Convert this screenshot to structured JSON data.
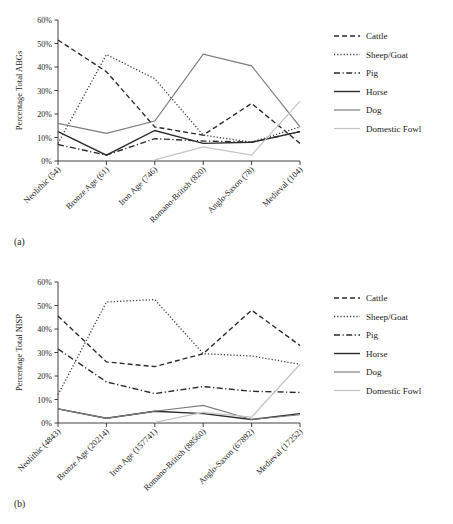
{
  "figure": {
    "panel_a_label": "(a)",
    "panel_b_label": "(b)"
  },
  "legend": {
    "entries": [
      {
        "name": "Cattle",
        "label": "Cattle",
        "color": "#2b2b2b",
        "dash": "5,3",
        "width": 1.4
      },
      {
        "name": "Sheep/Goat",
        "label": "Sheep/Goat",
        "color": "#3a3a3a",
        "dash": "1.2,2",
        "width": 1.3
      },
      {
        "name": "Pig",
        "label": "Pig",
        "color": "#2b2b2b",
        "dash": "6,2.5,1.2,2.5",
        "width": 1.4
      },
      {
        "name": "Horse",
        "label": "Horse",
        "color": "#2b2b2b",
        "dash": "none",
        "width": 1.4
      },
      {
        "name": "Dog",
        "label": "Dog",
        "color": "#7d7d7d",
        "dash": "none",
        "width": 1.2
      },
      {
        "name": "Domestic Fowl",
        "label": "Domestic Fowl",
        "color": "#c4c4c4",
        "dash": "none",
        "width": 1.2
      }
    ]
  },
  "chart_data": [
    {
      "id": "a",
      "type": "line",
      "title": "",
      "xlabel": "",
      "ylabel": "Percentage Total ABGs",
      "ylim": [
        0,
        60
      ],
      "yticks": [
        0,
        10,
        20,
        30,
        40,
        50,
        60
      ],
      "ytick_labels": [
        "0%",
        "10%",
        "20%",
        "30%",
        "40%",
        "50%",
        "60%"
      ],
      "grid": false,
      "legend_position": "right",
      "categories": [
        "Neolithic (54)",
        "Bronze Age (61)",
        "Iron Age (746)",
        "Romano-British (820)",
        "Anglo-Saxon (78)",
        "Medieval (104)"
      ],
      "series": [
        {
          "name": "Cattle",
          "values": [
            51.5,
            38.0,
            14.5,
            11.0,
            24.5,
            7.5
          ]
        },
        {
          "name": "Sheep/Goat",
          "values": [
            7.5,
            45.3,
            35.0,
            11.0,
            8.0,
            14.5
          ]
        },
        {
          "name": "Pig",
          "values": [
            7.0,
            2.5,
            9.5,
            8.5,
            8.0,
            12.5
          ]
        },
        {
          "name": "Horse",
          "values": [
            12.5,
            2.5,
            13.0,
            7.5,
            8.0,
            12.5
          ]
        },
        {
          "name": "Dog",
          "values": [
            16.0,
            11.8,
            17.0,
            45.5,
            40.5,
            14.5
          ]
        },
        {
          "name": "Domestic Fowl",
          "values": [
            null,
            null,
            0.5,
            6.0,
            2.5,
            25.5
          ]
        }
      ]
    },
    {
      "id": "b",
      "type": "line",
      "title": "",
      "xlabel": "",
      "ylabel": "Percentage Total NISP",
      "ylim": [
        0,
        60
      ],
      "yticks": [
        0,
        10,
        20,
        30,
        40,
        50,
        60
      ],
      "ytick_labels": [
        "0%",
        "10%",
        "20%",
        "30%",
        "40%",
        "50%",
        "60%"
      ],
      "grid": false,
      "legend_position": "right",
      "categories": [
        "Neolithic (4843)",
        "Bronze Age (20214)",
        "Iron Age (157741)",
        "Romano-British (88560)",
        "Anglo-Saxon (67892)",
        "Medieval (17252)"
      ],
      "series": [
        {
          "name": "Cattle",
          "values": [
            45.5,
            26.0,
            24.0,
            29.5,
            48.0,
            33.0
          ]
        },
        {
          "name": "Sheep/Goat",
          "values": [
            12.0,
            51.5,
            52.5,
            29.5,
            28.5,
            25.0
          ]
        },
        {
          "name": "Pig",
          "values": [
            31.5,
            17.5,
            12.5,
            15.5,
            13.5,
            13.0
          ]
        },
        {
          "name": "Horse",
          "values": [
            6.0,
            2.0,
            5.0,
            4.0,
            1.5,
            4.0
          ]
        },
        {
          "name": "Dog",
          "values": [
            6.0,
            2.0,
            5.0,
            7.5,
            1.5,
            3.5
          ]
        },
        {
          "name": "Domestic Fowl",
          "values": [
            null,
            null,
            0.3,
            4.5,
            2.5,
            25.0
          ]
        }
      ]
    }
  ]
}
